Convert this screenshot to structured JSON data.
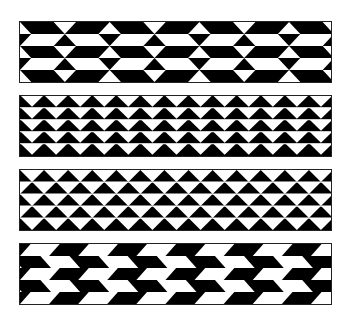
{
  "figure": {
    "colors": {
      "dark": "#000000",
      "light": "#ffffff",
      "border": "#222222"
    },
    "strips": [
      {
        "id": "strip-1",
        "top": 21,
        "pattern": "bowtie-bands",
        "rows": 5,
        "period": 44.7
      },
      {
        "id": "strip-2",
        "top": 95,
        "pattern": "down-triangles",
        "rows": 5,
        "period": 24
      },
      {
        "id": "strip-3",
        "top": 169,
        "pattern": "alternating-triangles",
        "rows": 5,
        "period": 24
      },
      {
        "id": "strip-4",
        "top": 243,
        "pattern": "chevron-parallelograms",
        "rows": 5,
        "period": 58
      }
    ]
  }
}
